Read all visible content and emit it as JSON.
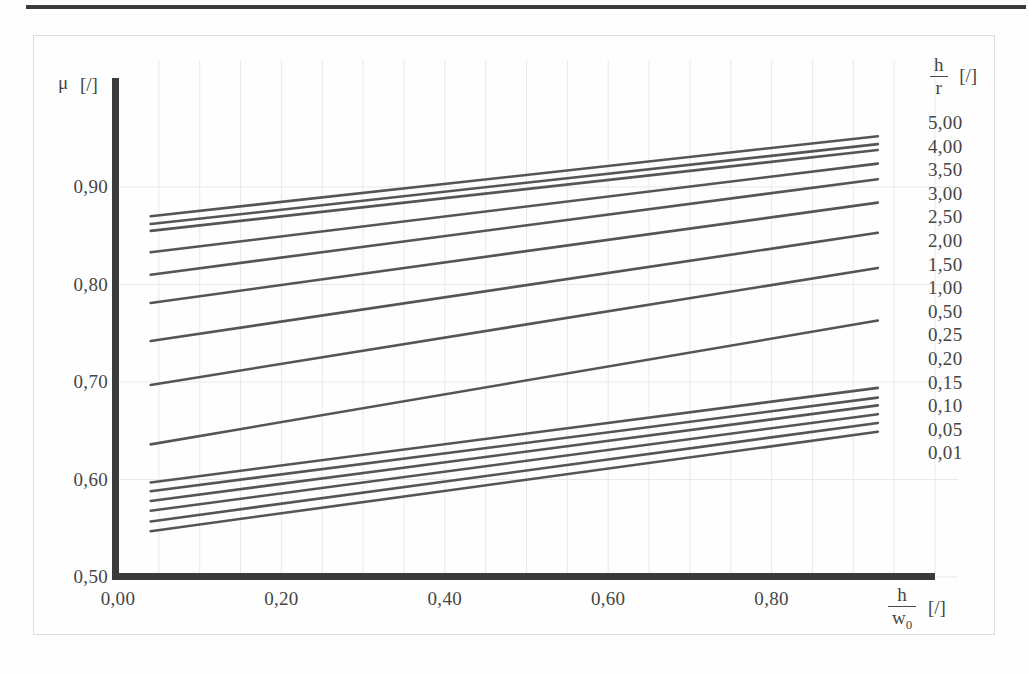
{
  "figure": {
    "background": "#fefefe",
    "line_color": "#555555",
    "axis_color": "#3a3a3a",
    "grid_color": "#e9e9e9",
    "top_rule_color": "#2b2b2b"
  },
  "axes": {
    "y_title_symbol": "μ",
    "y_title_unit": "[/]",
    "x_title_numerator": "h",
    "x_title_denominator": "w",
    "x_title_denominator_sub": "0",
    "x_title_unit": "[/]",
    "y_ticks": [
      "0,50",
      "0,60",
      "0,70",
      "0,80",
      "0,90"
    ],
    "y_tick_values": [
      0.5,
      0.6,
      0.7,
      0.8,
      0.9
    ],
    "x_ticks": [
      "0,00",
      "0,20",
      "0,40",
      "0,60",
      "0,80"
    ],
    "x_tick_values": [
      0.0,
      0.2,
      0.4,
      0.6,
      0.8
    ]
  },
  "legend": {
    "header_numerator": "h",
    "header_denominator": "r",
    "header_unit": "[/]",
    "labels": [
      "5,00",
      "4,00",
      "3,50",
      "3,00",
      "2,50",
      "2,00",
      "1,50",
      "1,00",
      "0,50",
      "0,25",
      "0,20",
      "0,15",
      "0,10",
      "0,05",
      "0,01"
    ]
  },
  "chart_data": {
    "type": "line",
    "title": "",
    "xlabel": "h/w0 [/]",
    "ylabel": "μ [/]",
    "xlim": [
      0.0,
      1.0
    ],
    "ylim": [
      0.5,
      0.96
    ],
    "grid": true,
    "legend_position": "right",
    "legend_title": "h/r [/]",
    "x": [
      0.04,
      0.93
    ],
    "series": [
      {
        "name": "5,00",
        "values": [
          0.87,
          0.952
        ]
      },
      {
        "name": "4,00",
        "values": [
          0.862,
          0.944
        ]
      },
      {
        "name": "3,50",
        "values": [
          0.855,
          0.938
        ]
      },
      {
        "name": "3,00",
        "values": [
          0.833,
          0.924
        ]
      },
      {
        "name": "2,50",
        "values": [
          0.81,
          0.908
        ]
      },
      {
        "name": "2,00",
        "values": [
          0.781,
          0.884
        ]
      },
      {
        "name": "1,50",
        "values": [
          0.742,
          0.853
        ]
      },
      {
        "name": "1,00",
        "values": [
          0.697,
          0.817
        ]
      },
      {
        "name": "0,50",
        "values": [
          0.636,
          0.763
        ]
      },
      {
        "name": "0,25",
        "values": [
          0.597,
          0.694
        ]
      },
      {
        "name": "0,20",
        "values": [
          0.588,
          0.684
        ]
      },
      {
        "name": "0,15",
        "values": [
          0.578,
          0.676
        ]
      },
      {
        "name": "0,10",
        "values": [
          0.568,
          0.667
        ]
      },
      {
        "name": "0,05",
        "values": [
          0.557,
          0.658
        ]
      },
      {
        "name": "0,01",
        "values": [
          0.547,
          0.649
        ]
      }
    ]
  }
}
